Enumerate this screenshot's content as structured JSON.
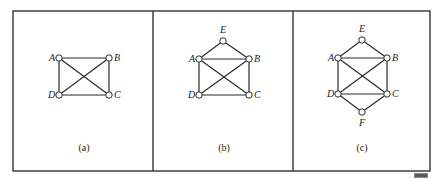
{
  "figure": {
    "frame": {
      "x": 13,
      "y": 11,
      "width": 417,
      "height": 160,
      "stroke": "#333333"
    },
    "dividers": [
      153,
      293
    ],
    "panels": [
      {
        "id": "a",
        "caption": "(a)",
        "caption_pos": [
          84,
          151
        ],
        "nodes": [
          {
            "id": "A",
            "label": "A",
            "x": 59,
            "y": 58,
            "lx": 49,
            "ly": 61
          },
          {
            "id": "B",
            "label": "B",
            "x": 109,
            "y": 58,
            "lx": 114,
            "ly": 61
          },
          {
            "id": "D",
            "label": "D",
            "x": 59,
            "y": 95,
            "lx": 48,
            "ly": 98
          },
          {
            "id": "C",
            "label": "C",
            "x": 109,
            "y": 95,
            "lx": 114,
            "ly": 98
          }
        ],
        "edges": [
          [
            "A",
            "B"
          ],
          [
            "A",
            "D"
          ],
          [
            "B",
            "C"
          ],
          [
            "D",
            "C"
          ],
          [
            "A",
            "C"
          ],
          [
            "B",
            "D"
          ]
        ]
      },
      {
        "id": "b",
        "caption": "(b)",
        "caption_pos": [
          224,
          151
        ],
        "nodes": [
          {
            "id": "E",
            "label": "E",
            "x": 223,
            "y": 41,
            "lx": 220,
            "ly": 33
          },
          {
            "id": "A",
            "label": "A",
            "x": 199,
            "y": 59,
            "lx": 189,
            "ly": 62
          },
          {
            "id": "B",
            "label": "B",
            "x": 249,
            "y": 59,
            "lx": 254,
            "ly": 62
          },
          {
            "id": "D",
            "label": "D",
            "x": 199,
            "y": 95,
            "lx": 188,
            "ly": 98
          },
          {
            "id": "C",
            "label": "C",
            "x": 249,
            "y": 95,
            "lx": 254,
            "ly": 98
          }
        ],
        "edges": [
          [
            "E",
            "A"
          ],
          [
            "E",
            "B"
          ],
          [
            "A",
            "B"
          ],
          [
            "A",
            "D"
          ],
          [
            "B",
            "C"
          ],
          [
            "D",
            "C"
          ],
          [
            "A",
            "C"
          ],
          [
            "B",
            "D"
          ]
        ]
      },
      {
        "id": "c",
        "caption": "(c)",
        "caption_pos": [
          362,
          151
        ],
        "nodes": [
          {
            "id": "E",
            "label": "E",
            "x": 362,
            "y": 40,
            "lx": 359,
            "ly": 32
          },
          {
            "id": "A",
            "label": "A",
            "x": 338,
            "y": 58,
            "lx": 328,
            "ly": 61
          },
          {
            "id": "B",
            "label": "B",
            "x": 387,
            "y": 58,
            "lx": 392,
            "ly": 61
          },
          {
            "id": "D",
            "label": "D",
            "x": 338,
            "y": 94,
            "lx": 327,
            "ly": 97
          },
          {
            "id": "C",
            "label": "C",
            "x": 387,
            "y": 94,
            "lx": 392,
            "ly": 97
          },
          {
            "id": "F",
            "label": "F",
            "x": 362,
            "y": 112,
            "lx": 359,
            "ly": 126
          }
        ],
        "edges": [
          [
            "E",
            "A"
          ],
          [
            "E",
            "B"
          ],
          [
            "A",
            "B"
          ],
          [
            "A",
            "D"
          ],
          [
            "B",
            "C"
          ],
          [
            "D",
            "C"
          ],
          [
            "A",
            "C"
          ],
          [
            "B",
            "D"
          ],
          [
            "D",
            "F"
          ],
          [
            "C",
            "F"
          ]
        ]
      }
    ]
  }
}
